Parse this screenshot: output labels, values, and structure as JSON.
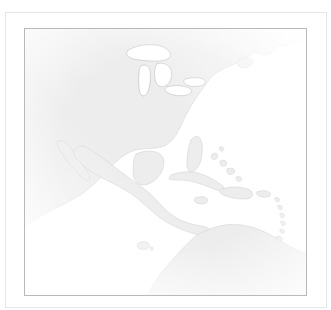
{
  "document": {
    "kind": "reference-map-figure",
    "title": "",
    "caption": ""
  },
  "frame": {
    "outer_border_color": "#e6e6e8",
    "page_background": "#ffffff"
  },
  "map": {
    "name": "americas-caribbean-reference-map",
    "projection_hint": "equirectangular",
    "border_color": "#b9b9bd",
    "land_fill": "#ededee",
    "land_stroke": "#d8d8db",
    "water_fill": "#ffffff",
    "lake_stroke": "#c8c8cc",
    "labels": [],
    "graticule": false,
    "legend": null,
    "scalebar": null,
    "north_arrow": null,
    "regions": [
      {
        "name": "north-america",
        "label": ""
      },
      {
        "name": "greenland-sliver",
        "label": ""
      },
      {
        "name": "great-lakes",
        "label": ""
      },
      {
        "name": "newfoundland",
        "label": ""
      },
      {
        "name": "florida-peninsula",
        "label": ""
      },
      {
        "name": "baja-california",
        "label": ""
      },
      {
        "name": "yucatan-peninsula",
        "label": ""
      },
      {
        "name": "central-america",
        "label": ""
      },
      {
        "name": "cuba",
        "label": ""
      },
      {
        "name": "hispaniola",
        "label": ""
      },
      {
        "name": "jamaica",
        "label": ""
      },
      {
        "name": "puerto-rico",
        "label": ""
      },
      {
        "name": "bahamas",
        "label": ""
      },
      {
        "name": "lesser-antilles",
        "label": ""
      },
      {
        "name": "trinidad",
        "label": ""
      },
      {
        "name": "south-america",
        "label": ""
      },
      {
        "name": "galapagos-islands",
        "label": ""
      }
    ]
  }
}
